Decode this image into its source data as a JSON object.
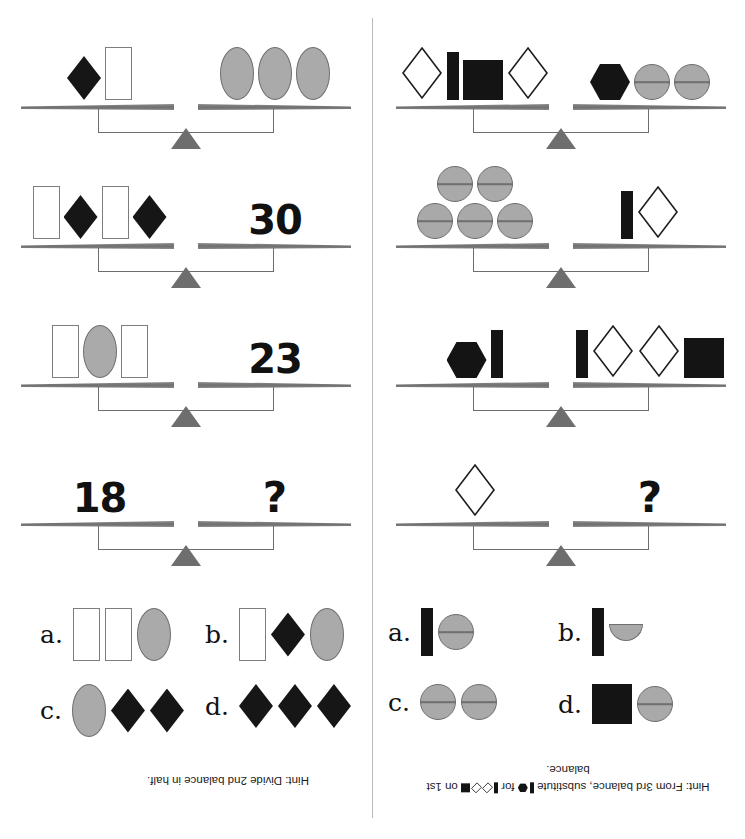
{
  "page": {
    "divider": true
  },
  "shapes_legend": {
    "white-rectangle": "tall white rectangle with gray outline",
    "black-diamond": "solid black diamond",
    "gray-oval": "gray filled oval with dark outline",
    "white-diamond": "outlined white diamond",
    "black-bar": "narrow solid black vertical bar",
    "black-square": "solid black square",
    "black-hexagon": "solid black hexagon",
    "gray-circle": "gray filled circle with horizontal diameter line",
    "gray-half-circle": "gray filled lower half circle"
  },
  "left_puzzle": {
    "name": "Puzzle 1",
    "balances": [
      {
        "id": "balance-1",
        "left": {
          "type": "shapes",
          "items": [
            "black-diamond",
            "white-rectangle"
          ]
        },
        "right": {
          "type": "shapes",
          "items": [
            "gray-oval",
            "gray-oval",
            "gray-oval"
          ]
        }
      },
      {
        "id": "balance-2",
        "left": {
          "type": "shapes",
          "items": [
            "white-rectangle",
            "black-diamond",
            "white-rectangle",
            "black-diamond"
          ]
        },
        "right": {
          "type": "number",
          "value": "30"
        }
      },
      {
        "id": "balance-3",
        "left": {
          "type": "shapes",
          "items": [
            "white-rectangle",
            "gray-oval",
            "white-rectangle"
          ]
        },
        "right": {
          "type": "number",
          "value": "23"
        }
      },
      {
        "id": "balance-4",
        "left": {
          "type": "number",
          "value": "18"
        },
        "right": {
          "type": "number",
          "value": "?"
        }
      }
    ],
    "answers": [
      {
        "label": "a.",
        "items": [
          "white-rectangle",
          "white-rectangle",
          "gray-oval"
        ]
      },
      {
        "label": "b.",
        "items": [
          "white-rectangle",
          "black-diamond",
          "gray-oval"
        ]
      },
      {
        "label": "c.",
        "items": [
          "gray-oval",
          "black-diamond",
          "black-diamond"
        ]
      },
      {
        "label": "d.",
        "items": [
          "black-diamond",
          "black-diamond",
          "black-diamond"
        ]
      }
    ],
    "hint": {
      "prefix": "Hint:  Divide 2nd balance in half.",
      "suffix": "",
      "line2": ""
    }
  },
  "right_puzzle": {
    "name": "Puzzle 2",
    "balances": [
      {
        "id": "balance-1",
        "left": {
          "type": "shapes",
          "items": [
            "white-diamond",
            "black-bar",
            "black-square",
            "white-diamond"
          ]
        },
        "right": {
          "type": "shapes",
          "items": [
            "black-hexagon",
            "gray-circle",
            "gray-circle"
          ]
        }
      },
      {
        "id": "balance-2",
        "left": {
          "type": "shapes-stacked",
          "rows": [
            [
              "gray-circle",
              "gray-circle"
            ],
            [
              "gray-circle",
              "gray-circle",
              "gray-circle"
            ]
          ]
        },
        "right": {
          "type": "shapes",
          "items": [
            "black-bar",
            "white-diamond"
          ]
        }
      },
      {
        "id": "balance-3",
        "left": {
          "type": "shapes",
          "items": [
            "black-hexagon",
            "black-bar"
          ]
        },
        "right": {
          "type": "shapes",
          "items": [
            "black-bar",
            "white-diamond",
            "white-diamond",
            "black-square"
          ]
        }
      },
      {
        "id": "balance-4",
        "left": {
          "type": "shapes",
          "items": [
            "white-diamond"
          ]
        },
        "right": {
          "type": "number",
          "value": "?"
        }
      }
    ],
    "answers": [
      {
        "label": "a.",
        "items": [
          "black-bar",
          "gray-circle"
        ]
      },
      {
        "label": "b.",
        "items": [
          "black-bar",
          "gray-half-circle"
        ]
      },
      {
        "label": "c.",
        "items": [
          "gray-circle",
          "gray-circle"
        ]
      },
      {
        "label": "d.",
        "items": [
          "black-square",
          "gray-circle"
        ]
      }
    ],
    "hint": {
      "prefix": "Hint:  From 3rd balance, substitute",
      "mid_glyphs_a": [
        "black-bar",
        "black-hexagon"
      ],
      "middle": "for",
      "mid_glyphs_b": [
        "black-bar",
        "white-diamond",
        "white-diamond",
        "black-square"
      ],
      "suffix": "on 1st balance."
    }
  },
  "colors": {
    "black_shape": "#141414",
    "gray_shape": "#a9a9a9",
    "shape_outline": "#6f6f6f",
    "beam_gray": "#7a7a7a",
    "fulcrum_gray": "#6e6e6e",
    "text": "#111111",
    "divider": "#b9b9b9",
    "background": "#ffffff"
  }
}
